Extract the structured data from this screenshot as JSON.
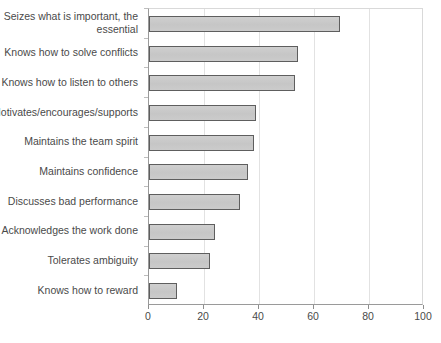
{
  "chart_data": {
    "type": "bar",
    "orientation": "horizontal",
    "title": "",
    "subtitle": "",
    "xlabel": "",
    "ylabel": "",
    "xlim": [
      0,
      100
    ],
    "xticks": [
      0,
      20,
      40,
      60,
      80,
      100
    ],
    "grid": true,
    "legend": null,
    "series_name": "",
    "categories": [
      "Seizes what is important, the essential",
      "Knows how to solve conflicts",
      "Knows how to listen to others",
      "Motivates/encourages/supports",
      "Maintains the team spirit",
      "Maintains confidence",
      "Discusses bad performance",
      "Acknowledges the work done",
      "Tolerates ambiguity",
      "Knows how to reward"
    ],
    "category_lines": [
      [
        "Seizes what is important, the",
        "essential"
      ],
      [
        "Knows how to solve conflicts"
      ],
      [
        "Knows how to listen to others"
      ],
      [
        "Motivates/encourages/supports"
      ],
      [
        "Maintains the team spirit"
      ],
      [
        "Maintains confidence"
      ],
      [
        "Discusses bad performance"
      ],
      [
        "Acknowledges the work done"
      ],
      [
        "Tolerates ambiguity"
      ],
      [
        "Knows how to reward"
      ]
    ],
    "values": [
      69.5,
      54,
      53,
      39,
      38,
      36,
      33,
      24,
      22,
      10
    ],
    "colors": {
      "bar_fill": "#c9c9c9",
      "bar_border": "#5e5e5e",
      "gridline": "#e2e2e2",
      "axis": "#9a9a9a",
      "text": "#4a4a4a",
      "background": "#ffffff"
    }
  }
}
